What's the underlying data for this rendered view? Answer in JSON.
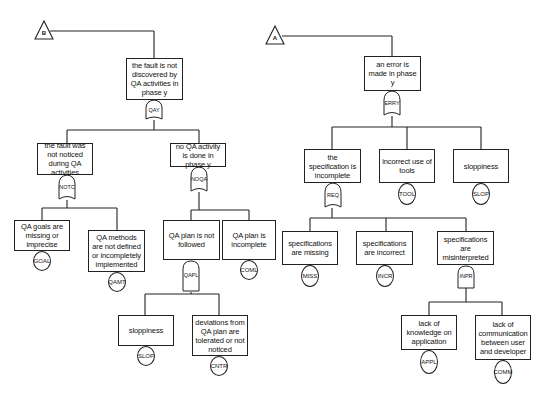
{
  "diagram": {
    "type": "fault-tree",
    "trees": [
      {
        "transfer": "B",
        "top_event": "the fault is not discovered by QA activities in phase y",
        "gate": "QAY",
        "gate_type": "OR",
        "children": [
          {
            "event": "the fault was not noticed during QA activities",
            "gate": "NOTC",
            "gate_type": "OR",
            "children": [
              {
                "event": "QA goals are missing or imprecise",
                "basic": "GOAL"
              },
              {
                "event": "QA methods are not defined or incompletely implemented",
                "basic": "QAMT"
              }
            ]
          },
          {
            "event": "no QA activity is done in phase y",
            "gate": "NOQA",
            "gate_type": "OR",
            "children": [
              {
                "event": "QA plan is not followed",
                "gate": "QAPL",
                "gate_type": "AND",
                "children": [
                  {
                    "event": "sloppiness",
                    "basic": "SLOP"
                  },
                  {
                    "event": "deviations from QA plan are tolerated or not noticed",
                    "basic": "CNTR"
                  }
                ]
              },
              {
                "event": "QA plan is incomplete",
                "basic": "COML"
              }
            ]
          }
        ]
      },
      {
        "transfer": "A",
        "top_event": "an error is made in phase y",
        "gate": "ERRY",
        "gate_type": "OR",
        "children": [
          {
            "event": "the specification is incomplete",
            "gate": "REQ",
            "gate_type": "OR",
            "children": [
              {
                "event": "specifications are missing",
                "basic": "MISS"
              },
              {
                "event": "specifications are incorrect",
                "basic": "INCR"
              },
              {
                "event": "specifications are misinterpreted",
                "gate": "INPR",
                "gate_type": "AND",
                "children": [
                  {
                    "event": "lack of knowledge on application",
                    "basic": "APPL"
                  },
                  {
                    "event": "lack of communication between user and developer",
                    "basic": "COMM"
                  }
                ]
              }
            ]
          },
          {
            "event": "incorrect use of tools",
            "basic": "TOOL"
          },
          {
            "event": "sloppiness",
            "basic": "SLOP"
          }
        ]
      }
    ]
  },
  "labels": {
    "tri_b": "B",
    "tri_a": "A",
    "b_top": "the fault is not discovered by QA activities in phase y",
    "g_qay": "QAY",
    "b_notc_ev": "the fault was not noticed during QA activities",
    "g_notc": "NOTC",
    "b_noqa_ev": "no QA activity is done in phase y",
    "g_noqa": "NOQA",
    "b_goal_ev": "QA goals are missing or imprecise",
    "c_goal": "GOAL",
    "b_qamt_ev": "QA methods are not defined or incompletely implemented",
    "c_qamt": "QAMT",
    "b_qapl_ev": "QA plan is not followed",
    "g_qapl": "QAPL",
    "b_coml_ev": "QA plan is incomplete",
    "c_coml": "COML",
    "b_slop_ev": "sloppiness",
    "c_slop": "SLOP",
    "b_cntr_ev": "deviations from QA plan are tolerated or not noticed",
    "c_cntr": "CNTR",
    "a_top": "an error is made in phase y",
    "g_erry": "ERRY",
    "a_req_ev": "the specification is incomplete",
    "g_req": "REQ",
    "a_tool_ev": "incorrect use of tools",
    "c_tool": "TOOL",
    "a_slop_ev": "sloppiness",
    "c_slop2": "SLOP",
    "a_miss_ev": "specifications are missing",
    "c_miss": "MISS",
    "a_incr_ev": "specifications are incorrect",
    "c_incr": "INCR",
    "a_inpr_ev": "specifications are misinterpreted",
    "g_inpr": "INPR",
    "a_appl_ev": "lack of knowledge on application",
    "c_appl": "APPL",
    "a_comm_ev": "lack of communication between user and developer",
    "c_comm": "COMM"
  }
}
